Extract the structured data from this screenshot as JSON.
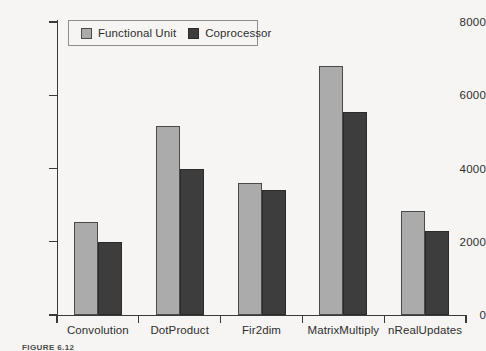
{
  "chart_data": {
    "type": "bar",
    "title": "",
    "xlabel": "",
    "ylabel": "",
    "ylim": [
      0,
      8000
    ],
    "yticks": [
      0,
      2000,
      4000,
      6000,
      8000
    ],
    "ytick_labels": [
      "0",
      "2000",
      "4000",
      "6000",
      "8000"
    ],
    "grid": false,
    "legend_position": "top-left",
    "categories": [
      "Convolution",
      "DotProduct",
      "Fir2dim",
      "MatrixMultiply",
      "nRealUpdates"
    ],
    "series": [
      {
        "name": "Functional Unit",
        "color": "#ababab",
        "values": [
          2550,
          5150,
          3600,
          6800,
          2850
        ]
      },
      {
        "name": "Coprocessor",
        "color": "#3d3d3d",
        "values": [
          2000,
          4000,
          3420,
          5550,
          2300
        ]
      }
    ]
  },
  "legend": {
    "entries": [
      {
        "label": "Functional Unit",
        "swatch": "light"
      },
      {
        "label": "Coprocessor",
        "swatch": "dark"
      }
    ]
  },
  "caption": {
    "text": "FIGURE 6.12"
  },
  "colors": {
    "background": "#f6f5f3",
    "axis": "#3a3a3a",
    "text": "#2e2e2e",
    "series_light": "#ababab",
    "series_dark": "#3d3d3d"
  }
}
